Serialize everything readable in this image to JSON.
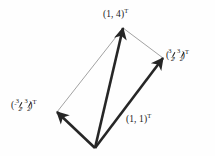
{
  "figure": {
    "kind": "vector-diagram",
    "background_color": "#fefefe",
    "ink_color": "#262626",
    "thin_line_color": "#8a8a8a",
    "origin": {
      "x": 95,
      "y": 148
    },
    "labels": {
      "top": {
        "text": "(1, 4)T",
        "display": "(1, 4)",
        "superscript": "T",
        "x": 103,
        "y": 8
      },
      "right": {
        "display_open": "(",
        "numerator_1": "3",
        "denominator_1": "2",
        "separator": ", ",
        "numerator_2": "3",
        "denominator_2": "2",
        "display_close": ")",
        "superscript": "T",
        "x": 166,
        "y": 49
      },
      "left": {
        "display_open": "(",
        "minus": "-",
        "numerator_1": "3",
        "denominator_1": "2",
        "separator": ", ",
        "numerator_2": "3",
        "denominator_2": "2",
        "display_close": ")",
        "superscript": "T",
        "x": 11,
        "y": 99
      },
      "bottom": {
        "text": "(1, 1)T",
        "display": "(1, 1)",
        "superscript": "T",
        "x": 126,
        "y": 113
      }
    },
    "vectors": [
      {
        "name": "vector-1-4",
        "label_key": "top",
        "from_x": 95,
        "from_y": 148,
        "to_x": 123,
        "to_y": 28,
        "stroke": "#262626",
        "width": 2.6,
        "arrowhead": true
      },
      {
        "name": "vector-3over2-3over2",
        "label_key": "right",
        "from_x": 95,
        "from_y": 148,
        "to_x": 163,
        "to_y": 58,
        "stroke": "#262626",
        "width": 2.6,
        "arrowhead": true
      },
      {
        "name": "vector-neg3over2-3over2",
        "label_key": "left",
        "from_x": 95,
        "from_y": 148,
        "to_x": 57,
        "to_y": 112,
        "stroke": "#262626",
        "width": 2.6,
        "arrowhead": true
      }
    ],
    "connector_lines": [
      {
        "name": "connector-left-to-top",
        "from_x": 57,
        "from_y": 112,
        "to_x": 123,
        "to_y": 28,
        "stroke": "#8a8a8a",
        "width": 0.8
      },
      {
        "name": "connector-top-to-right",
        "from_x": 123,
        "from_y": 28,
        "to_x": 163,
        "to_y": 58,
        "stroke": "#8a8a8a",
        "width": 0.8
      }
    ]
  }
}
